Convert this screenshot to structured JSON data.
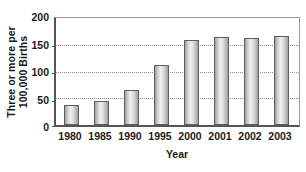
{
  "chart_data": {
    "type": "bar",
    "title": "",
    "xlabel": "Year",
    "ylabel": "Three or more per 100,000 Births",
    "ylabel_lines": [
      "Three or more per",
      "100,000 Births"
    ],
    "categories": [
      "1980",
      "1985",
      "1990",
      "1995",
      "2000",
      "2001",
      "2002",
      "2003"
    ],
    "values": [
      37,
      44,
      65,
      113,
      158,
      165,
      163,
      166
    ],
    "ylim": [
      0,
      200
    ],
    "yticks": [
      0,
      50,
      100,
      150,
      200
    ],
    "ytick_labels": [
      "0",
      "50",
      "100",
      "150",
      "200"
    ],
    "grid": "horizontal-dotted",
    "legend": "none",
    "series": [
      {
        "name": "Three or more per 100,000 Births",
        "values": [
          37,
          44,
          65,
          113,
          158,
          165,
          163,
          166
        ]
      }
    ],
    "colors": {
      "bar_fill_light": "#efefef",
      "bar_fill_dark": "#9e9e9e",
      "bar_border": "#5e5e5e",
      "axis": "#555555",
      "frame": "#9a9a9a",
      "gridline": "#8d8d8d",
      "text": "#1a1a1a",
      "background": "#ffffff"
    }
  }
}
